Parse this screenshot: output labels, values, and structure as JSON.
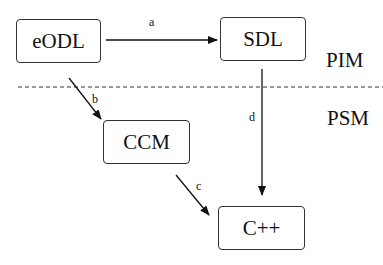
{
  "nodes": {
    "eodl": "eODL",
    "sdl": "SDL",
    "ccm": "CCM",
    "cpp": "C++"
  },
  "edges": {
    "a": "a",
    "b": "b",
    "c": "c",
    "d": "d"
  },
  "regions": {
    "pim": "PIM",
    "psm": "PSM"
  }
}
